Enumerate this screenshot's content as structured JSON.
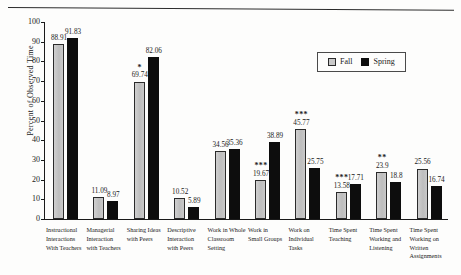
{
  "chart_data": {
    "type": "bar",
    "title": "",
    "xlabel": "",
    "ylabel": "Percent of Observed Time",
    "ylim": [
      0,
      100
    ],
    "ytick_step": 10,
    "yticks": [
      "100",
      "90",
      "80",
      "70",
      "60",
      "50",
      "40",
      "30",
      "20",
      "10",
      "0"
    ],
    "grid": false,
    "legend_position": "upper-right",
    "categories": [
      "Instructional Interactions With Teachers",
      "Managerial Interaction with Teachers",
      "Sharing Ideas with Peers",
      "Descriptive Interaction with Peers",
      "Work in Whole Classroom Setting",
      "Work in Small Groups",
      "Work on Individual Tasks",
      "Time Spent Teaching",
      "Time Spent Working and Listening",
      "Time Spent Working on Written Assignments"
    ],
    "category_lines": [
      [
        "Instructional",
        "Interactions",
        "With Teachers"
      ],
      [
        "Managerial",
        "Interaction",
        "with Teachers"
      ],
      [
        "Sharing Ideas",
        "with Peers"
      ],
      [
        "Descriptive",
        "Interaction",
        "with Peers"
      ],
      [
        "Work in Whole",
        "Classroom",
        "Setting"
      ],
      [
        "Work in",
        "Small Groups"
      ],
      [
        "Work on",
        "Individual",
        "Tasks"
      ],
      [
        "Time Spent",
        "Teaching"
      ],
      [
        "Time Spent",
        "Working and",
        "Listening"
      ],
      [
        "Time Spent",
        "Working on",
        "Written",
        "Assignments"
      ]
    ],
    "series": [
      {
        "name": "Fall",
        "color": "#c6c6c6",
        "values": [
          88.91,
          11.09,
          69.74,
          10.52,
          34.56,
          19.67,
          45.77,
          13.58,
          23.9,
          25.56
        ],
        "labels": [
          "88.91",
          "11.09",
          "69.74",
          "10.52",
          "34.56",
          "19.67",
          "45.77",
          "13.58",
          "23.9",
          "25.56"
        ]
      },
      {
        "name": "Spring",
        "color": "#0d0d0d",
        "values": [
          91.83,
          8.97,
          82.06,
          5.89,
          35.36,
          38.89,
          25.75,
          17.71,
          18.8,
          16.74
        ],
        "labels": [
          "91.83",
          "8.97",
          "82.06",
          "5.89",
          "35.36",
          "38.89",
          "25.75",
          "17.71",
          "18.8",
          "16.74"
        ]
      }
    ],
    "significance_markers": [
      "",
      "",
      "*",
      "",
      "",
      "***",
      "***",
      "***",
      "**",
      ""
    ]
  },
  "legend": {
    "items": [
      {
        "label": "Fall",
        "color": "#c6c6c6"
      },
      {
        "label": "Spring",
        "color": "#0d0d0d"
      }
    ]
  }
}
